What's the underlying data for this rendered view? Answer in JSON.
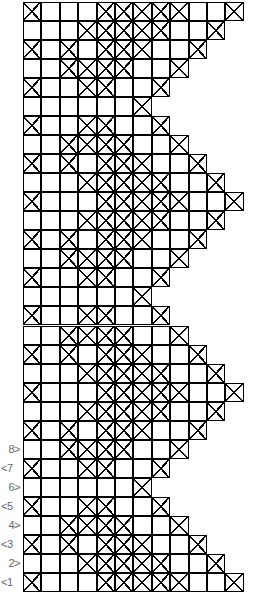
{
  "chart_title": "",
  "grid": {
    "cell_width": 18.4,
    "row_height": 19.03,
    "left": 23,
    "top": 2,
    "line_color": "#000000"
  },
  "row_types": {
    "A": {
      "length": 12,
      "crossed": [
        1,
        5,
        6,
        7,
        8,
        9,
        12
      ]
    },
    "B": {
      "length": 11,
      "crossed": [
        4,
        5,
        6,
        7,
        8,
        11
      ]
    },
    "C": {
      "length": 10,
      "crossed": [
        1,
        3,
        5,
        6,
        7,
        10
      ]
    },
    "D": {
      "length": 9,
      "crossed": [
        3,
        4,
        5,
        6,
        9
      ]
    },
    "E": {
      "length": 8,
      "crossed": [
        1,
        4,
        5,
        8
      ]
    },
    "F": {
      "length": 7,
      "crossed": [
        7
      ]
    },
    "G": {
      "length": 8,
      "crossed": [
        1,
        4,
        5,
        8
      ]
    },
    "H": {
      "length": 9,
      "crossed": [
        3,
        4,
        5,
        6,
        9
      ]
    },
    "I": {
      "length": 10,
      "crossed": [
        1,
        3,
        5,
        6,
        7,
        10
      ]
    },
    "J": {
      "length": 11,
      "crossed": [
        4,
        5,
        6,
        7,
        8,
        11
      ]
    }
  },
  "rows_top_to_bottom": [
    "A",
    "B",
    "C",
    "D",
    "E",
    "F",
    "G",
    "H",
    "I",
    "J",
    "A",
    "B",
    "C",
    "D",
    "E",
    "F",
    "G",
    "H",
    "I",
    "J",
    "A",
    "B",
    "C",
    "D",
    "E",
    "F",
    "G",
    "H",
    "I",
    "J",
    "A"
  ],
  "row_labels": [
    {
      "row_index": 23,
      "text": "8>",
      "side": "even"
    },
    {
      "row_index": 24,
      "text": "<7",
      "side": "odd"
    },
    {
      "row_index": 25,
      "text": "6>",
      "side": "even"
    },
    {
      "row_index": 26,
      "text": "<5",
      "side": "odd"
    },
    {
      "row_index": 27,
      "text": "4>",
      "side": "even"
    },
    {
      "row_index": 28,
      "text": "<3",
      "side": "odd"
    },
    {
      "row_index": 29,
      "text": "2>",
      "side": "even"
    },
    {
      "row_index": 30,
      "text": "<1",
      "side": "odd"
    }
  ],
  "legend": {
    "crossed_cell": "X symbol (crossed square)",
    "empty_cell": "plain square"
  }
}
